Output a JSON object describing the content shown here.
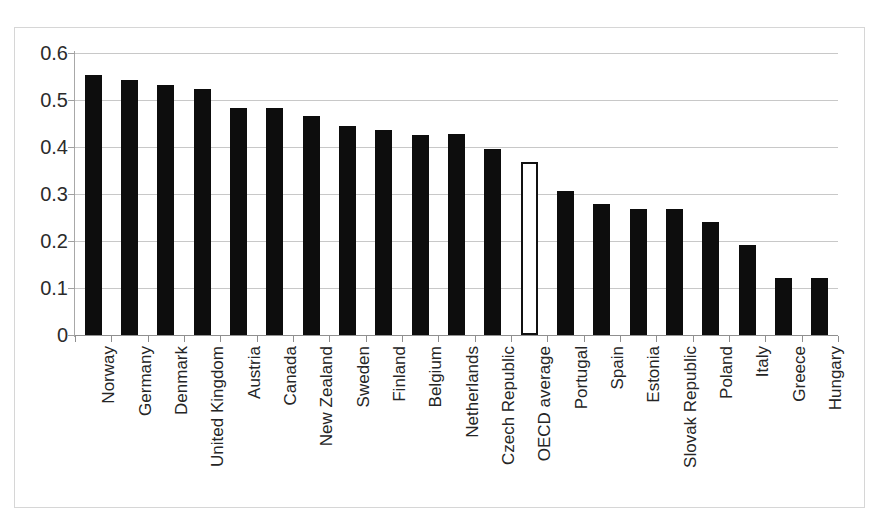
{
  "chart_data": {
    "type": "bar",
    "title": "",
    "subtitle": "",
    "xlabel": "",
    "ylabel": "",
    "ylim": [
      0,
      0.6
    ],
    "ytick_values": [
      0.6,
      0.5,
      0.4,
      0.3,
      0.2,
      0.1,
      0
    ],
    "ytick_labels": [
      "0.6",
      "0.5",
      "0.4",
      "0.3",
      "0.2",
      "0.1",
      "0"
    ],
    "grid": true,
    "grid_axis": "y",
    "legend": false,
    "legend_position": "none",
    "bar_color": "#0d0d0d",
    "highlight_color": "#ffffff",
    "highlight_border_color": "#111111",
    "highlight_category": "OECD average",
    "categories": [
      "Norway",
      "Germany",
      "Denmark",
      "United Kingdom",
      "Austria",
      "Canada",
      "New Zealand",
      "Sweden",
      "Finland",
      "Belgium",
      "Netherlands",
      "Czech Republic",
      "OECD average",
      "Portugal",
      "Spain",
      "Estonia",
      "Slovak Republic",
      "Poland",
      "Italy",
      "Greece",
      "Hungary"
    ],
    "values": [
      0.553,
      0.542,
      0.533,
      0.523,
      0.483,
      0.484,
      0.465,
      0.444,
      0.436,
      0.426,
      0.427,
      0.396,
      0.368,
      0.307,
      0.278,
      0.268,
      0.269,
      0.24,
      0.191,
      0.121,
      0.122
    ],
    "highlighted": [
      false,
      false,
      false,
      false,
      false,
      false,
      false,
      false,
      false,
      false,
      false,
      false,
      true,
      false,
      false,
      false,
      false,
      false,
      false,
      false,
      false
    ]
  }
}
